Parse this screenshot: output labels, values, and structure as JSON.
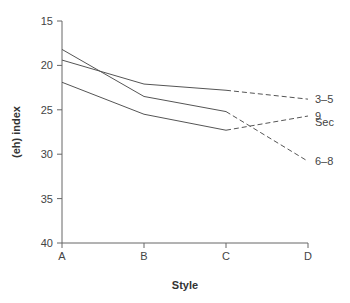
{
  "chart_data": {
    "type": "line",
    "title": "",
    "xlabel": "Style",
    "ylabel": "(eh) index",
    "categories": [
      "A",
      "B",
      "C",
      "D"
    ],
    "y_ticks": [
      15,
      20,
      25,
      30,
      35,
      40
    ],
    "ylim": [
      40,
      15
    ],
    "y_inverted": true,
    "grid": false,
    "legend_title": "Sec",
    "legend_position": "right, inline labels at line ends",
    "solid_segment": "A to C",
    "dashed_segment": "C to D",
    "series": [
      {
        "name": "3–5",
        "values": [
          19.4,
          22.1,
          22.8,
          23.8
        ]
      },
      {
        "name": "9",
        "values": [
          21.9,
          25.5,
          27.3,
          25.7
        ]
      },
      {
        "name": "6–8",
        "values": [
          18.2,
          23.5,
          25.2,
          30.8
        ]
      }
    ]
  },
  "labels": {
    "xlabel": "Style",
    "ylabel": "(eh) index",
    "legend_title": "Sec",
    "y_ticks": [
      "15",
      "20",
      "25",
      "30",
      "35",
      "40"
    ],
    "x_ticks": [
      "A",
      "B",
      "C",
      "D"
    ],
    "series": [
      "3–5",
      "9",
      "6–8"
    ]
  }
}
